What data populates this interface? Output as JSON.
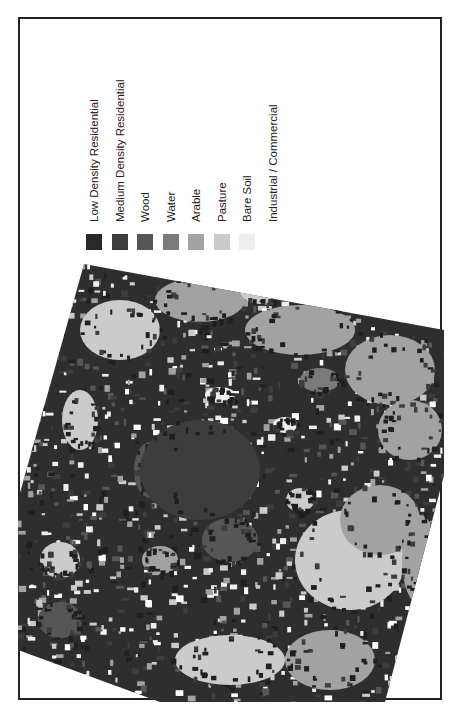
{
  "figure": {
    "frame": {
      "x": 18,
      "y": 17,
      "width": 424,
      "height": 683
    }
  },
  "legend": {
    "items": [
      {
        "label": "Low Density Residential",
        "color": "#2a2a2a"
      },
      {
        "label": "Medium Density Residential",
        "color": "#3d3d3d"
      },
      {
        "label": "Wood",
        "color": "#565656"
      },
      {
        "label": "Water",
        "color": "#7b7b7b"
      },
      {
        "label": "Arable",
        "color": "#a2a2a2"
      },
      {
        "label": "Pasture",
        "color": "#cbcbcb"
      },
      {
        "label": "Bare Soil",
        "color": "#eeeeee"
      },
      {
        "label": "Industrial / Commercial",
        "color": "#ffffff"
      }
    ]
  },
  "map": {
    "title": "Land cover classification",
    "outline": [
      [
        84,
        264
      ],
      [
        444,
        330
      ],
      [
        444,
        475
      ],
      [
        385,
        702
      ],
      [
        160,
        702
      ],
      [
        18,
        650
      ],
      [
        18,
        500
      ]
    ],
    "base_color": "#2e2e2e",
    "regions": [
      {
        "class": "Pasture",
        "cx": 120,
        "cy": 330,
        "rx": 40,
        "ry": 30
      },
      {
        "class": "Arable",
        "cx": 200,
        "cy": 300,
        "rx": 45,
        "ry": 22
      },
      {
        "class": "Arable",
        "cx": 300,
        "cy": 330,
        "rx": 55,
        "ry": 25
      },
      {
        "class": "Pasture",
        "cx": 260,
        "cy": 290,
        "rx": 20,
        "ry": 14
      },
      {
        "class": "Arable",
        "cx": 390,
        "cy": 370,
        "rx": 45,
        "ry": 35
      },
      {
        "class": "Water",
        "cx": 320,
        "cy": 380,
        "rx": 20,
        "ry": 12
      },
      {
        "class": "Arable",
        "cx": 410,
        "cy": 430,
        "rx": 32,
        "ry": 30
      },
      {
        "class": "Pasture",
        "cx": 350,
        "cy": 560,
        "rx": 55,
        "ry": 50
      },
      {
        "class": "Arable",
        "cx": 380,
        "cy": 520,
        "rx": 40,
        "ry": 35
      },
      {
        "class": "Pasture",
        "cx": 230,
        "cy": 660,
        "rx": 55,
        "ry": 25
      },
      {
        "class": "Arable",
        "cx": 330,
        "cy": 660,
        "rx": 45,
        "ry": 30
      },
      {
        "class": "Pasture",
        "cx": 60,
        "cy": 560,
        "rx": 20,
        "ry": 18
      },
      {
        "class": "Wood",
        "cx": 230,
        "cy": 540,
        "rx": 28,
        "ry": 22
      },
      {
        "class": "Wood",
        "cx": 60,
        "cy": 620,
        "rx": 22,
        "ry": 18
      },
      {
        "class": "Wood",
        "cx": 150,
        "cy": 470,
        "rx": 16,
        "ry": 28
      },
      {
        "class": "Medium Density Residential",
        "cx": 200,
        "cy": 470,
        "rx": 60,
        "ry": 50
      },
      {
        "class": "Pasture",
        "cx": 300,
        "cy": 500,
        "rx": 14,
        "ry": 12
      },
      {
        "class": "Bare Soil",
        "cx": 220,
        "cy": 395,
        "rx": 15,
        "ry": 8
      },
      {
        "class": "Bare Soil",
        "cx": 285,
        "cy": 425,
        "rx": 12,
        "ry": 8
      },
      {
        "class": "Pasture",
        "cx": 80,
        "cy": 420,
        "rx": 18,
        "ry": 30
      },
      {
        "class": "Arable",
        "cx": 160,
        "cy": 560,
        "rx": 18,
        "ry": 14
      },
      {
        "class": "Arable",
        "cx": 420,
        "cy": 560,
        "rx": 18,
        "ry": 45
      }
    ]
  }
}
